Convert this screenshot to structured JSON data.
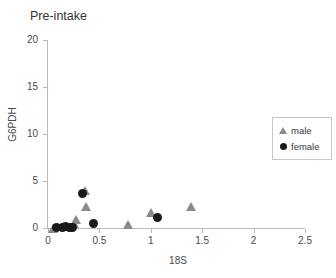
{
  "chart_data": {
    "type": "scatter",
    "title": "Pre-intake",
    "xlabel": "18S",
    "ylabel": "G6PDH",
    "xlim": [
      0,
      2.5
    ],
    "ylim": [
      0,
      20
    ],
    "xticks": [
      "0",
      "0.5",
      "1",
      "1.5",
      "2",
      "2.5"
    ],
    "xtick_values": [
      0,
      0.5,
      1,
      1.5,
      2,
      2.5
    ],
    "yticks": [
      "0",
      "5",
      "10",
      "15",
      "20"
    ],
    "ytick_values": [
      0,
      5,
      10,
      15,
      20
    ],
    "grid": false,
    "legend_position": "right",
    "series": [
      {
        "name": "male",
        "marker": "triangle",
        "color": "#8a8a8a",
        "points": [
          {
            "x": 0.05,
            "y": 0.0
          },
          {
            "x": 0.25,
            "y": 0.45
          },
          {
            "x": 0.27,
            "y": 0.9
          },
          {
            "x": 0.36,
            "y": 4.0
          },
          {
            "x": 0.37,
            "y": 2.3
          },
          {
            "x": 0.78,
            "y": 0.35
          },
          {
            "x": 1.0,
            "y": 1.6
          },
          {
            "x": 1.39,
            "y": 2.3
          }
        ]
      },
      {
        "name": "female",
        "marker": "circle",
        "color": "#1a1a1a",
        "points": [
          {
            "x": 0.08,
            "y": 0.05
          },
          {
            "x": 0.14,
            "y": 0.1
          },
          {
            "x": 0.17,
            "y": 0.12
          },
          {
            "x": 0.21,
            "y": 0.1
          },
          {
            "x": 0.24,
            "y": 0.1
          },
          {
            "x": 0.34,
            "y": 3.7
          },
          {
            "x": 0.44,
            "y": 0.5
          },
          {
            "x": 1.07,
            "y": 1.1
          }
        ]
      }
    ]
  },
  "legend": {
    "items": [
      {
        "label": "male",
        "marker": "triangle",
        "color": "#8a8a8a"
      },
      {
        "label": "female",
        "marker": "circle",
        "color": "#1a1a1a"
      }
    ]
  },
  "colors": {
    "male": "#8a8a8a",
    "female": "#1a1a1a",
    "axis": "#b9b9b9",
    "text": "#4a4a4a",
    "title": "#333333",
    "background": "#ffffff"
  }
}
